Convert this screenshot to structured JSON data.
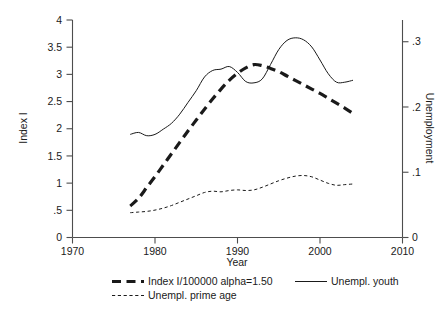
{
  "chart_data": {
    "type": "line",
    "title": "",
    "xlabel": "Year",
    "ylabel": "Index I",
    "y2label": "Unemployment",
    "xlim": [
      1970,
      2010
    ],
    "ylim": [
      0,
      4
    ],
    "y2lim": [
      0,
      0.3333
    ],
    "grid": false,
    "legend_position": "below",
    "xticks": [
      "1970",
      "1980",
      "1990",
      "2000",
      "2010"
    ],
    "xtick_values": [
      1970,
      1980,
      1990,
      2000,
      2010
    ],
    "yticks": [
      "0",
      ".5",
      "1",
      "1.5",
      "2",
      "2.5",
      "3",
      "3.5",
      "4"
    ],
    "ytick_values": [
      0,
      0.5,
      1,
      1.5,
      2,
      2.5,
      3,
      3.5,
      4
    ],
    "y2ticks": [
      "0",
      ".1",
      ".2",
      ".3"
    ],
    "y2tick_values": [
      0,
      0.1,
      0.2,
      0.3
    ],
    "series": [
      {
        "name": "Index I/100000 alpha=1.50",
        "axis": "left",
        "style": "thick-dashed",
        "x": [
          1977,
          1978,
          1979,
          1980,
          1981,
          1982,
          1983,
          1984,
          1985,
          1986,
          1987,
          1988,
          1989,
          1990,
          1991,
          1992,
          1993,
          1994,
          1995,
          1996,
          1997,
          1998,
          1999,
          2000,
          2001,
          2002,
          2003,
          2004
        ],
        "values": [
          0.58,
          0.72,
          0.92,
          1.12,
          1.33,
          1.54,
          1.75,
          1.96,
          2.16,
          2.36,
          2.55,
          2.73,
          2.89,
          3.02,
          3.12,
          3.18,
          3.16,
          3.11,
          3.05,
          2.97,
          2.89,
          2.81,
          2.73,
          2.65,
          2.56,
          2.47,
          2.38,
          2.28
        ]
      },
      {
        "name": "Unempl. youth",
        "axis": "right",
        "style": "thin-solid",
        "x": [
          1977,
          1978,
          1979,
          1980,
          1981,
          1982,
          1983,
          1984,
          1985,
          1986,
          1987,
          1988,
          1989,
          1990,
          1991,
          1992,
          1993,
          1994,
          1995,
          1996,
          1997,
          1998,
          1999,
          2000,
          2001,
          2002,
          2003,
          2004
        ],
        "values": [
          0.158,
          0.161,
          0.156,
          0.158,
          0.166,
          0.175,
          0.189,
          0.207,
          0.225,
          0.246,
          0.256,
          0.258,
          0.262,
          0.253,
          0.239,
          0.237,
          0.243,
          0.265,
          0.288,
          0.302,
          0.306,
          0.303,
          0.292,
          0.272,
          0.251,
          0.238,
          0.238,
          0.241
        ]
      },
      {
        "name": "Unempl. prime age",
        "axis": "right",
        "style": "thin-dashed",
        "x": [
          1977,
          1978,
          1979,
          1980,
          1981,
          1982,
          1983,
          1984,
          1985,
          1986,
          1987,
          1988,
          1989,
          1990,
          1991,
          1992,
          1993,
          1994,
          1995,
          1996,
          1997,
          1998,
          1999,
          2000,
          2001,
          2002,
          2003,
          2004
        ],
        "values": [
          0.038,
          0.039,
          0.04,
          0.042,
          0.045,
          0.049,
          0.054,
          0.059,
          0.064,
          0.069,
          0.071,
          0.07,
          0.072,
          0.073,
          0.072,
          0.073,
          0.077,
          0.082,
          0.087,
          0.091,
          0.094,
          0.095,
          0.093,
          0.088,
          0.083,
          0.08,
          0.081,
          0.082
        ]
      }
    ]
  },
  "legend": {
    "items": [
      {
        "label": "Index I/100000 alpha=1.50",
        "style": "thick-dashed"
      },
      {
        "label": "Unempl. youth",
        "style": "thin-solid"
      },
      {
        "label": "Unempl. prime age",
        "style": "thin-dashed"
      }
    ]
  },
  "axes": {
    "x_title": "Year",
    "y_title": "Index I",
    "y2_title": "Unemployment"
  },
  "colors": {
    "line": "#1a1a1a",
    "axis": "#4d4d4d",
    "background": "#ffffff"
  }
}
